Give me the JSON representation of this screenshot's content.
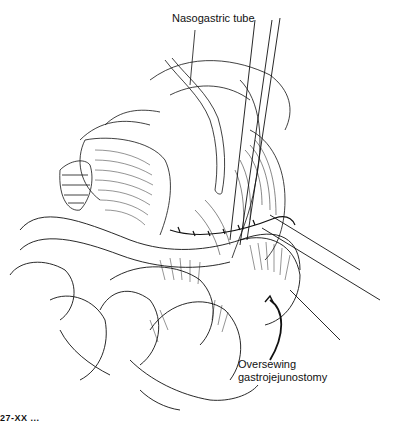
{
  "figure": {
    "type": "surgical line illustration",
    "labels": [
      {
        "id": "nasogastric-tube",
        "text": "Nasogastric tube"
      },
      {
        "id": "oversewing",
        "lines": [
          "Oversewing",
          "gastrojejunostomy"
        ]
      }
    ],
    "caption_fragment": "27-XX  ..."
  }
}
